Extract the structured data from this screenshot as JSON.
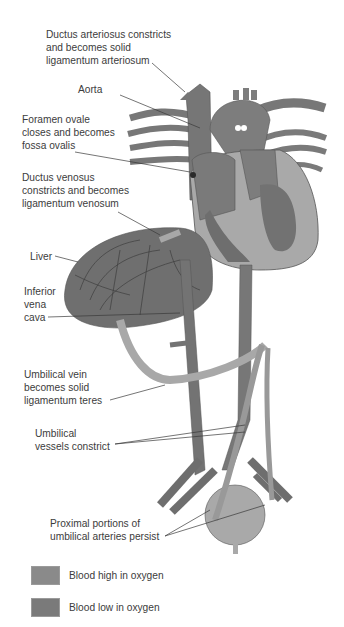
{
  "figure": {
    "labels": {
      "ductus_arteriosus": [
        "Ductus arteriosus constricts",
        "and becomes solid",
        "ligamentum arteriosum"
      ],
      "aorta": [
        "Aorta"
      ],
      "foramen_ovale": [
        "Foramen ovale",
        "closes and becomes",
        "fossa ovalis"
      ],
      "ductus_venosus": [
        "Ductus venosus",
        "constricts and becomes",
        "ligamentum venosum"
      ],
      "liver": [
        "Liver"
      ],
      "inferior_vena_cava": [
        "Inferior",
        "vena",
        "cava"
      ],
      "umbilical_vein": [
        "Umbilical vein",
        "becomes solid",
        "ligamentum teres"
      ],
      "umbilical_vessels": [
        "Umbilical",
        "vessels constrict"
      ],
      "umbilical_arteries": [
        "Proximal portions of",
        "umbilical arteries persist"
      ]
    }
  },
  "legend": {
    "items": [
      {
        "label": "Blood high in oxygen",
        "color": "#8a8a8a"
      },
      {
        "label": "Blood low in oxygen",
        "color": "#7a7a7a"
      }
    ]
  },
  "colors": {
    "vessel_dark": "#6f6f6f",
    "vessel_mid": "#858585",
    "vessel_light": "#a8a8a8",
    "outline": "#4a4a4a",
    "leader": "#3a3a3a"
  }
}
